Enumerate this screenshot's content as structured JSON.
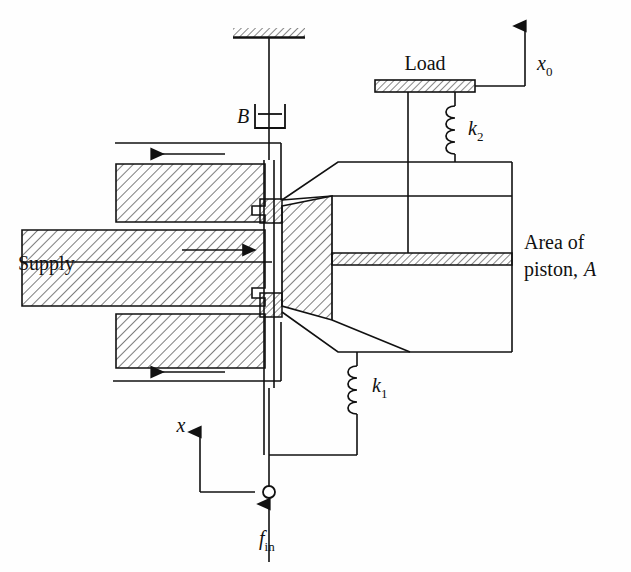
{
  "figure": {
    "domain_type": "engineering-schematic",
    "canvas": {
      "width": 631,
      "height": 572
    },
    "colors": {
      "background": "#fefefe",
      "line": "#111111",
      "hatch": "#111111"
    }
  },
  "labels": {
    "supply": "Supply",
    "load": "Load",
    "damper": "B",
    "spring_upper": "k",
    "spring_upper_sub": "2",
    "spring_lower": "k",
    "spring_lower_sub": "1",
    "output_disp": "x",
    "output_disp_sub": "0",
    "input_disp": "x",
    "input_force": "f",
    "input_force_sub": "in",
    "piston_area_line1": "Area of",
    "piston_area_line2": "piston,",
    "piston_area_symbol": "A"
  },
  "components": [
    {
      "id": "ground-support",
      "name": "fixed-ground-hatched",
      "label": "",
      "description": "Hatched fixed support at top anchoring the damper"
    },
    {
      "id": "damper-B",
      "name": "viscous-damper",
      "label": "B",
      "description": "Viscous damper connecting ground to valve stem"
    },
    {
      "id": "valve-body",
      "name": "spool-valve-body",
      "label": "",
      "description": "Hatched valve housing with supply and return ports"
    },
    {
      "id": "spool",
      "name": "valve-spool",
      "label": "",
      "description": "Two-land spool on vertical stem"
    },
    {
      "id": "linkage",
      "name": "walking-beam-linkage",
      "label": "",
      "description": "Trapezoidal hatched linkage block between spool and actuator"
    },
    {
      "id": "actuator-cylinder",
      "name": "actuator-cylinder",
      "label": "",
      "description": "Right-hand cylinder containing the power piston"
    },
    {
      "id": "piston",
      "name": "power-piston",
      "label": "Area of piston, A",
      "description": "Hatched horizontal piston plate"
    },
    {
      "id": "spring-k2",
      "name": "spring-k2",
      "label": "k2",
      "description": "Coil spring between load platform and cylinder top"
    },
    {
      "id": "spring-k1",
      "name": "spring-k1",
      "label": "k1",
      "description": "Coil spring between lower linkage and feedback bar"
    },
    {
      "id": "load-platform",
      "name": "load-platform",
      "label": "Load",
      "description": "Hatched load plate on the piston rod"
    },
    {
      "id": "input-joint",
      "name": "input-pivot-joint",
      "label": "",
      "description": "Small open circle where the input force is applied"
    }
  ],
  "flow_arrows": [
    {
      "id": "return-top",
      "direction": "left",
      "port": "upper-return"
    },
    {
      "id": "supply",
      "direction": "right",
      "port": "supply"
    },
    {
      "id": "return-bottom",
      "direction": "left",
      "port": "lower-return"
    }
  ],
  "reference_arrows": [
    {
      "id": "x0",
      "label": "x0",
      "direction": "up",
      "meaning": "output displacement datum"
    },
    {
      "id": "x",
      "label": "x",
      "direction": "up",
      "meaning": "input stem displacement datum"
    },
    {
      "id": "fin",
      "label": "fin",
      "direction": "up",
      "meaning": "input force"
    }
  ]
}
